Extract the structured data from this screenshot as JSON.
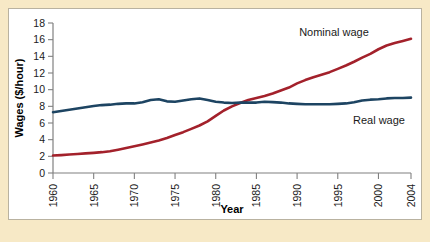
{
  "figure": {
    "background_color": "#f7e9c6",
    "panel_color": "#ffffff",
    "border_color": "#b9b2a0"
  },
  "chart_data": {
    "type": "line",
    "title": "",
    "subtitle": "",
    "xlabel": "Year",
    "ylabel": "Wages ($/hour)",
    "xlim": [
      1960,
      2004
    ],
    "ylim": [
      0,
      18
    ],
    "grid": false,
    "legend_position": "inline-annotations",
    "x_ticks": [
      1960,
      1965,
      1970,
      1975,
      1980,
      1985,
      1990,
      1995,
      2000,
      2004
    ],
    "x_tick_labels": [
      "1960",
      "1965",
      "1970",
      "1975",
      "1980",
      "1985",
      "1990",
      "1995",
      "2000",
      "2004"
    ],
    "x_minor_ticks": [
      1960,
      1961,
      1962,
      1963,
      1964,
      1965,
      1966,
      1967,
      1968,
      1969,
      1970,
      1971,
      1972,
      1973,
      1974,
      1975,
      1976,
      1977,
      1978,
      1979,
      1980,
      1981,
      1982,
      1983,
      1984,
      1985,
      1986,
      1987,
      1988,
      1989,
      1990,
      1991,
      1992,
      1993,
      1994,
      1995,
      1996,
      1997,
      1998,
      1999,
      2000,
      2001,
      2002,
      2003,
      2004
    ],
    "y_ticks": [
      0,
      2,
      4,
      6,
      8,
      10,
      12,
      14,
      16,
      18
    ],
    "y_tick_labels": [
      "0",
      "2",
      "4",
      "6",
      "8",
      "10",
      "12",
      "14",
      "16",
      "18"
    ],
    "x": [
      1960,
      1961,
      1962,
      1963,
      1964,
      1965,
      1966,
      1967,
      1968,
      1969,
      1970,
      1971,
      1972,
      1973,
      1974,
      1975,
      1976,
      1977,
      1978,
      1979,
      1980,
      1981,
      1982,
      1983,
      1984,
      1985,
      1986,
      1987,
      1988,
      1989,
      1990,
      1991,
      1992,
      1993,
      1994,
      1995,
      1996,
      1997,
      1998,
      1999,
      2000,
      2001,
      2002,
      2003,
      2004
    ],
    "series": [
      {
        "name": "Nominal wage",
        "color": "#a3212b",
        "label_text": "Nominal wage",
        "values": [
          2.1,
          2.15,
          2.22,
          2.28,
          2.35,
          2.42,
          2.5,
          2.62,
          2.8,
          3.0,
          3.2,
          3.42,
          3.65,
          3.9,
          4.2,
          4.55,
          4.9,
          5.3,
          5.7,
          6.2,
          6.85,
          7.5,
          8.0,
          8.4,
          8.75,
          9.0,
          9.25,
          9.55,
          9.9,
          10.25,
          10.75,
          11.15,
          11.5,
          11.8,
          12.1,
          12.5,
          12.9,
          13.35,
          13.85,
          14.3,
          14.85,
          15.3,
          15.6,
          15.85,
          16.1
        ]
      },
      {
        "name": "Real wage",
        "color": "#1d4462",
        "label_text": "Real wage",
        "values": [
          7.3,
          7.45,
          7.6,
          7.75,
          7.9,
          8.05,
          8.15,
          8.2,
          8.3,
          8.35,
          8.35,
          8.5,
          8.75,
          8.85,
          8.6,
          8.55,
          8.7,
          8.85,
          8.95,
          8.75,
          8.55,
          8.45,
          8.4,
          8.45,
          8.45,
          8.45,
          8.55,
          8.5,
          8.45,
          8.35,
          8.3,
          8.25,
          8.25,
          8.25,
          8.25,
          8.3,
          8.35,
          8.5,
          8.7,
          8.8,
          8.85,
          8.95,
          9.0,
          9.0,
          9.05
        ]
      }
    ],
    "annotations": [
      {
        "text": "Nominal wage",
        "x_px": 333,
        "y_px": 35
      },
      {
        "text": "Real wage",
        "x_px": 378,
        "y_px": 123
      }
    ]
  }
}
